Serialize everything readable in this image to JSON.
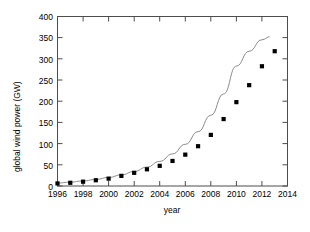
{
  "chart_data": {
    "type": "scatter",
    "title": "",
    "xlabel": "year",
    "ylabel": "global wind power (GW)",
    "xlim": [
      1996,
      2014
    ],
    "ylim": [
      0,
      400
    ],
    "xticks": [
      1996,
      1998,
      2000,
      2002,
      2004,
      2006,
      2008,
      2010,
      2012,
      2014
    ],
    "xtick_labels": [
      "1996",
      "1998",
      "2000",
      "2002",
      "2004",
      "2006",
      "2008",
      "2010",
      "2012",
      "2014"
    ],
    "yticks": [
      0,
      50,
      100,
      150,
      200,
      250,
      300,
      350,
      400
    ],
    "ytick_labels": [
      "0",
      "50",
      "100",
      "150",
      "200",
      "250",
      "300",
      "350",
      "400"
    ],
    "grid": false,
    "legend": false,
    "marker": "filled-square",
    "marker_color": "#000000",
    "line_color": "#808080",
    "x": [
      1996,
      1997,
      1998,
      1999,
      2000,
      2001,
      2002,
      2003,
      2004,
      2005,
      2006,
      2007,
      2008,
      2009,
      2010,
      2011,
      2012,
      2013
    ],
    "values": [
      6.1,
      7.6,
      10.2,
      13.6,
      17.4,
      23.9,
      31.1,
      39.4,
      47.6,
      59.1,
      74.0,
      93.9,
      120.6,
      158.0,
      197.9,
      238.0,
      282.6,
      318.1
    ],
    "series": [
      {
        "name": "global wind power",
        "type": "scatter",
        "values": [
          6.1,
          7.6,
          10.2,
          13.6,
          17.4,
          23.9,
          31.1,
          39.4,
          47.6,
          59.1,
          74.0,
          93.9,
          120.6,
          158.0,
          197.9,
          238.0,
          282.6,
          318.1
        ]
      },
      {
        "name": "exponential fit",
        "type": "line",
        "x": [
          1996,
          1997,
          1998,
          1999,
          2000,
          2001,
          2002,
          2003,
          2004,
          2005,
          2006,
          2007,
          2008,
          2009,
          2010,
          2011,
          2012,
          2012.6
        ],
        "values": [
          7.0,
          9.1,
          11.9,
          15.5,
          20.2,
          26.3,
          34.2,
          44.6,
          58.1,
          75.6,
          98.4,
          128.2,
          166.9,
          217.3,
          282.9,
          318.0,
          345.0,
          352.0
        ]
      }
    ]
  },
  "axes": {
    "x_title": "year",
    "y_title": "global wind power (GW)"
  }
}
